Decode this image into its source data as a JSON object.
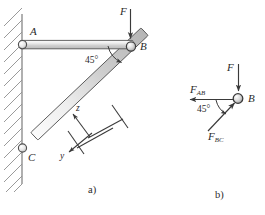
{
  "figure": {
    "type": "engineering-statics-diagram",
    "panels": [
      {
        "key": "a",
        "label": "a)",
        "caption": "wall-mounted two-member truss"
      },
      {
        "key": "b",
        "label": "b)",
        "caption": "free-body diagram of joint B"
      }
    ]
  },
  "panel_a": {
    "label": "a)",
    "joints": [
      {
        "name": "A",
        "label": "A",
        "x": 22,
        "y": 44,
        "support": "pin-on-wall"
      },
      {
        "name": "B",
        "label": "B",
        "x": 131,
        "y": 47,
        "support": "pin"
      },
      {
        "name": "C",
        "label": "C",
        "x": 22,
        "y": 148,
        "support": "pin-on-wall"
      }
    ],
    "members": [
      {
        "name": "AB",
        "from": "A",
        "to": "B",
        "orientation": "horizontal"
      },
      {
        "name": "BC",
        "from": "B",
        "to": "C",
        "orientation": "diagonal"
      }
    ],
    "wall": {
      "hatching": "diagonal",
      "side": "left"
    },
    "angle": {
      "label": "45°",
      "value": 45,
      "at_joint": "B",
      "between": "AB and BC"
    },
    "load": {
      "label": "F",
      "direction": "down",
      "applied_at": "B"
    },
    "axes": {
      "z": {
        "label": "z",
        "direction": "up-left"
      },
      "y": {
        "label": "y",
        "direction": "down-left"
      }
    }
  },
  "panel_b": {
    "label": "b)",
    "joint": {
      "name": "B",
      "label": "B"
    },
    "forces": [
      {
        "name": "F",
        "label": "F",
        "direction": "down"
      },
      {
        "name": "F_AB",
        "label_main": "F",
        "label_sub": "AB",
        "direction": "left"
      },
      {
        "name": "F_BC",
        "label_main": "F",
        "label_sub": "BC",
        "direction": "down-left-45"
      }
    ],
    "angle": {
      "label": "45°",
      "value": 45,
      "at_joint": "B"
    }
  },
  "colors": {
    "ink": "#2b2b2b",
    "line": "#4a4a4a",
    "member_fill_light": "#f2f2f2",
    "member_fill_mid": "#d9d9d9",
    "member_edge": "#555555",
    "hatch": "#8a8a8a",
    "arrow": "#3a3a3a"
  }
}
